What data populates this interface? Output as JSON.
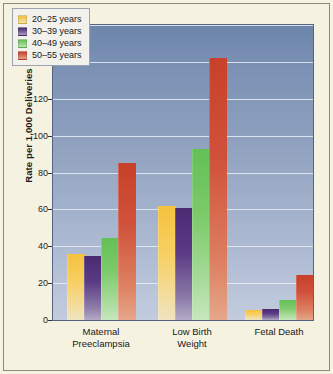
{
  "figure": {
    "background_color": "#f6f2e1",
    "border_color": "#8d8a78",
    "plot_background_top": "#6d85ab",
    "plot_background_bottom": "#c3ccde",
    "gridline_color": "#e9eef5"
  },
  "chart_data": {
    "type": "bar",
    "title": "",
    "subtitle": "",
    "xlabel": "",
    "ylabel": "Rate per 1,000 Deliveries",
    "ylim": [
      0,
      160
    ],
    "ytick_step": 20,
    "yticks": [
      0,
      20,
      40,
      60,
      80,
      100,
      120,
      140,
      160
    ],
    "ytick_labels": [
      "0",
      "20",
      "40",
      "60",
      "80",
      "100",
      "120",
      "140",
      "160"
    ],
    "grid": true,
    "grid_axis": "y",
    "legend_position": "upper left",
    "categories": [
      "Maternal Preeclampsia",
      "Low Birth Weight",
      "Fetal Death"
    ],
    "category_lines": [
      [
        "Maternal",
        "Preeclampsia"
      ],
      [
        "Low Birth",
        "Weight"
      ],
      [
        "Fetal Death",
        ""
      ]
    ],
    "series": [
      {
        "name": "20–25 years",
        "color": "#f5c23e",
        "values": [
          36,
          62,
          5.5
        ]
      },
      {
        "name": "30–39 years",
        "color": "#4a2b72",
        "values": [
          34.5,
          60.5,
          6
        ]
      },
      {
        "name": "40–49 years",
        "color": "#63c056",
        "values": [
          44.5,
          93,
          11
        ]
      },
      {
        "name": "50–55 years",
        "color": "#c8412a",
        "values": [
          85,
          142,
          24.5
        ]
      }
    ]
  }
}
